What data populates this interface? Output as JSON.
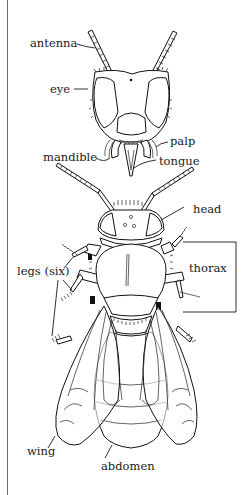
{
  "diagram": {
    "labels": {
      "antenna": "antenna",
      "eye": "eye",
      "palp": "palp",
      "mandible": "mandible",
      "tongue": "tongue",
      "head": "head",
      "legs": "legs (six)",
      "thorax": "thorax",
      "wing": "wing",
      "abdomen": "abdomen"
    }
  }
}
